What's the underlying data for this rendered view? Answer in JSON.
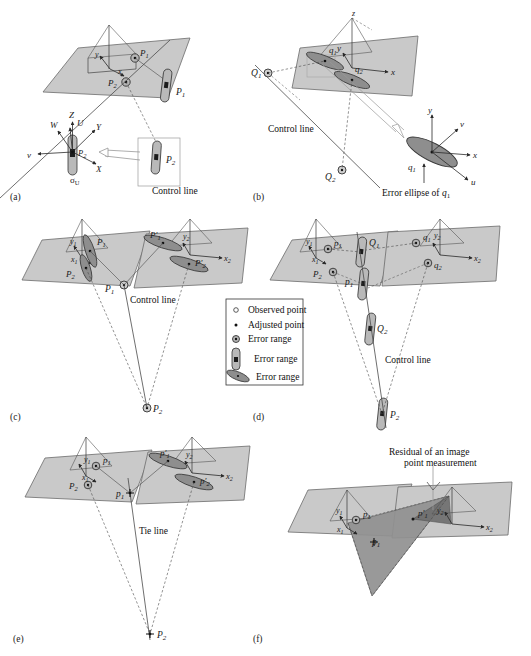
{
  "figure": {
    "panels": [
      "(a)",
      "(b)",
      "(c)",
      "(d)",
      "(e)",
      "(f)"
    ],
    "colors": {
      "plane_fill": "#c9c9c9",
      "plane_stroke": "#6b6b6b",
      "ellipse_fill": "#8e8e8e",
      "ellipse_stroke": "#3a3a3a",
      "capsule_fill": "#b4b4b4",
      "capsule_stroke": "#3a3a3a",
      "triangle_fill": "#919191",
      "triangle_dark_fill": "#6e6e6e",
      "line": "#4a4a4a",
      "text": "#1a1a1a"
    }
  },
  "legend": {
    "items": [
      {
        "symbol": "open-circle",
        "label": "Observed point"
      },
      {
        "symbol": "filled-dot",
        "label": "Adjusted point"
      },
      {
        "symbol": "circle-dot",
        "label": "Error range"
      },
      {
        "symbol": "vertical-capsule",
        "label": "Error range"
      },
      {
        "symbol": "diagonal-ellipse",
        "label": "Error range"
      }
    ]
  },
  "panel_a": {
    "tag": "(a)",
    "axes_plane": [
      "z",
      "y",
      "x"
    ],
    "plane_points": [
      "P1",
      "P2"
    ],
    "space_points": [
      "P1",
      "P2"
    ],
    "detail_axes": [
      "Z",
      "W",
      "U",
      "Y",
      "X",
      "v"
    ],
    "detail_point": "P2",
    "detail_sigma": "σU",
    "caption": "Control line"
  },
  "panel_b": {
    "tag": "(b)",
    "axes_plane": [
      "z",
      "y",
      "x"
    ],
    "plane_points": [
      "q1",
      "q2"
    ],
    "space_points": [
      "Q1",
      "Q2"
    ],
    "caption": "Control line",
    "ellipse_axes": [
      "y",
      "v",
      "x",
      "u"
    ],
    "ellipse_point": "q1",
    "ellipse_caption": "Error ellipse of q1"
  },
  "panel_c": {
    "tag": "(c)",
    "left_axes": [
      "y1",
      "x1"
    ],
    "left_points": [
      "P1",
      "P2"
    ],
    "right_axes": [
      "y2",
      "x2"
    ],
    "right_points": [
      "P'1",
      "P'2"
    ],
    "space_points": [
      "P1",
      "P2"
    ],
    "caption": "Control line"
  },
  "panel_d": {
    "tag": "(d)",
    "left_axes": [
      "y1",
      "x1"
    ],
    "left_points": [
      "p1",
      "P2"
    ],
    "right_axes": [
      "y2",
      "x2"
    ],
    "right_points": [
      "q1",
      "q2"
    ],
    "space_points": [
      "Q1",
      "p1",
      "Q2",
      "P2"
    ],
    "caption": "Control line"
  },
  "panel_e": {
    "tag": "(e)",
    "left_axes": [
      "y1",
      "x1"
    ],
    "left_points": [
      "p1",
      "P2"
    ],
    "right_axes": [
      "y2",
      "x2"
    ],
    "right_points": [
      "p'1",
      "p'2"
    ],
    "space_points": [
      "p1",
      "P2"
    ],
    "caption": "Tie line"
  },
  "panel_f": {
    "tag": "(f)",
    "left_axes": [
      "y1",
      "x1"
    ],
    "left_points": [
      "p1"
    ],
    "right_axes": [
      "y2",
      "x2"
    ],
    "right_points": [
      "p'1"
    ],
    "space_points": [
      "p1"
    ],
    "caption_line1": "Residual of an image",
    "caption_line2": "point measurement"
  }
}
